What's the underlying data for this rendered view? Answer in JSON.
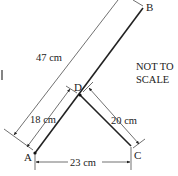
{
  "diagram": {
    "points": {
      "A": {
        "label": "A",
        "x": 35,
        "y": 153
      },
      "B": {
        "label": "B",
        "x": 143,
        "y": 8
      },
      "C": {
        "label": "C",
        "x": 131,
        "y": 146
      },
      "D": {
        "label": "D",
        "x": 80,
        "y": 95
      }
    },
    "dimensions": {
      "AB": "47 cm",
      "AD": "18 cm",
      "DC": "20 cm",
      "AC": "23 cm"
    },
    "note_line1": "NOT TO",
    "note_line2": "SCALE",
    "colors": {
      "line": "#222222",
      "dim": "#333333"
    }
  }
}
